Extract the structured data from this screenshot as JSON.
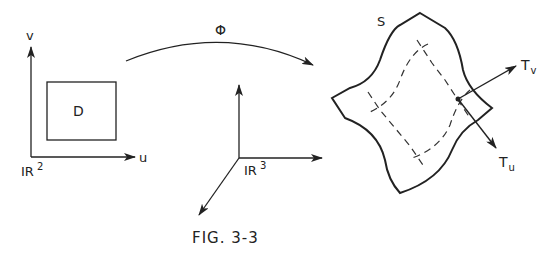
{
  "figure": {
    "caption": "FIG. 3-3",
    "domain_panel": {
      "space_label": "IR",
      "space_exponent": "2",
      "axis_u_label": "u",
      "axis_v_label": "v",
      "region_label": "D"
    },
    "mapping": {
      "label": "Φ"
    },
    "target_panel": {
      "space_label": "IR",
      "space_exponent": "3"
    },
    "surface": {
      "label": "S",
      "tangent_v_label": "T",
      "tangent_v_subscript": "v",
      "tangent_u_label": "T",
      "tangent_u_subscript": "u"
    },
    "colors": {
      "ink": "#222222",
      "background": "#ffffff"
    }
  }
}
